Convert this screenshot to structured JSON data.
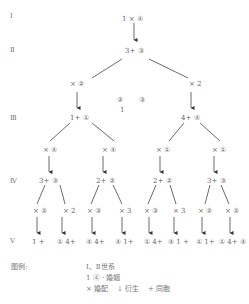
{
  "generations": [
    "Ⅰ",
    "Ⅱ",
    "Ⅲ",
    "Ⅳ",
    "Ⅴ"
  ],
  "nodes": {
    "g1": "1 × ④",
    "g2": "3+ ③",
    "g2_op_left": "× ②",
    "g2_op_right": "× 2",
    "middle_note_a": "②",
    "middle_note_b": "③",
    "middle_note_c": "1",
    "g3_left": "1+ ①",
    "g3_right": "4+ ④",
    "g3_ops": [
      "× ④",
      "× ④",
      "× ①",
      "× ①"
    ],
    "g4": [
      "3+ ③",
      "2+ ②",
      "2+ ②",
      "3+ ③"
    ],
    "g4_ops": [
      "× ②",
      "× 2",
      "× ③",
      "× 3",
      "× ③",
      "× 3",
      "× ②",
      "× ②"
    ],
    "g5": [
      "1 +",
      "① 4+",
      "④ 4+",
      "④ 1+",
      "① 4+",
      "④ 1 +",
      "① 1+",
      "① 4+ ④"
    ]
  },
  "legend": {
    "title": "图例:",
    "line1": "Ⅰ、Ⅱ世系",
    "line2": "1 ④ · 婚姻",
    "line3_marry": "×  婚配",
    "line3_descent": "↓  衍生",
    "line3_sibling": "+ 同胞"
  }
}
